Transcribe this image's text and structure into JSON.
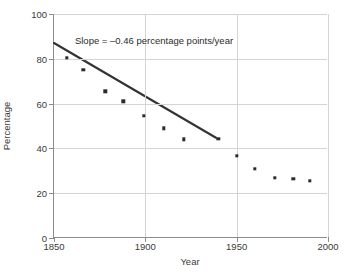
{
  "chart_data": {
    "type": "scatter",
    "title": "",
    "xlabel": "Year",
    "ylabel": "Percentage",
    "xlim": [
      1850,
      2000
    ],
    "ylim": [
      0,
      100
    ],
    "xticks": [
      "1850",
      "1900",
      "1950",
      "2000"
    ],
    "yticks": [
      "0",
      "20",
      "40",
      "60",
      "80",
      "100"
    ],
    "grid": true,
    "legend": "none",
    "annotations": [
      {
        "name": "slope-annotation",
        "text": "Slope = –0.46 percentage points/year",
        "x": 1862,
        "y": 88
      }
    ],
    "series": [
      {
        "name": "percentage",
        "marker": "square",
        "color": "#2b2b2b",
        "x": [
          1857,
          1866,
          1878,
          1888,
          1899,
          1910,
          1921,
          1940,
          1950,
          1960,
          1971,
          1981,
          1990
        ],
        "y": [
          80.5,
          75.0,
          65.5,
          61.0,
          54.5,
          49.0,
          44.0,
          44.3,
          36.8,
          31.0,
          27.0,
          26.5,
          25.5
        ]
      }
    ],
    "trendline": {
      "name": "regression-line",
      "color": "#333333",
      "slope": -0.46,
      "units": "percentage points/year",
      "x_start": 1850,
      "y_start": 87.0,
      "x_end": 1939,
      "y_end": 44.5
    }
  }
}
